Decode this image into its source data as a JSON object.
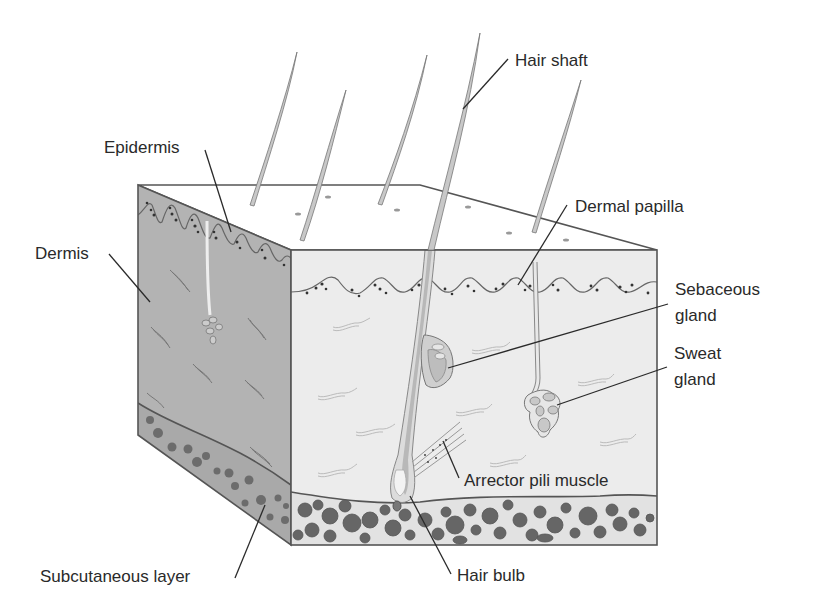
{
  "colors": {
    "background": "#ffffff",
    "top_face": "#d6d6d6",
    "left_face": "#b3b3b3",
    "front_face": "#ececec",
    "subcutaneous_left": "#a9a9a9",
    "subcutaneous_front": "#e2e2e2",
    "fat_cells": "#666666",
    "outline": "#555555",
    "label_text": "#2a2a2a"
  },
  "labels": {
    "epidermis": "Epidermis",
    "dermis": "Dermis",
    "subcutaneous_layer": "Subcutaneous layer",
    "hair_shaft": "Hair shaft",
    "dermal_papilla": "Dermal papilla",
    "sebaceous_gland_line1": "Sebaceous",
    "sebaceous_gland_line2": "gland",
    "sweat_gland_line1": "Sweat",
    "sweat_gland_line2": "gland",
    "arrector_pili_muscle": "Arrector pili muscle",
    "hair_bulb": "Hair bulb"
  }
}
